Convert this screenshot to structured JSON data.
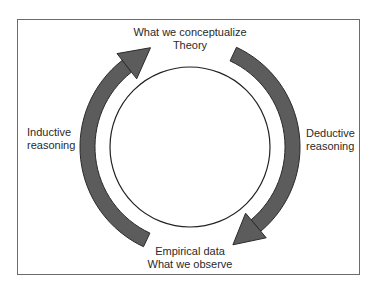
{
  "diagram": {
    "type": "research-cycle",
    "top": {
      "line1": "What we conceptualize",
      "line2": "Theory"
    },
    "bottom": {
      "line1": "Empirical data",
      "line2": "What we observe"
    },
    "left": {
      "line1": "Inductive",
      "line2": "reasoning"
    },
    "right": {
      "line1": "Deductive",
      "line2": "reasoning"
    },
    "colors": {
      "arrow_fill": "#5c5c5c",
      "arrow_stroke": "#2a2a2a",
      "circle_stroke": "#222222",
      "frame": "#6b6b6b"
    }
  }
}
